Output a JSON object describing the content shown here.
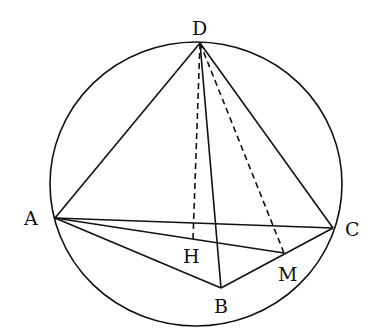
{
  "diagram": {
    "type": "geometry-figure",
    "stroke_color": "#111111",
    "background": "#ffffff",
    "circle": {
      "cx": 196,
      "cy": 184,
      "rx": 146,
      "ry": 142
    },
    "points": {
      "D": {
        "label": "D",
        "x": 200,
        "y": 43,
        "label_x": 192,
        "label_y": 35
      },
      "A": {
        "label": "A",
        "x": 55,
        "y": 218,
        "label_x": 24,
        "label_y": 225
      },
      "C": {
        "label": "C",
        "x": 333,
        "y": 228,
        "label_x": 345,
        "label_y": 236
      },
      "B": {
        "label": "B",
        "x": 221,
        "y": 288,
        "label_x": 214,
        "label_y": 313
      },
      "H": {
        "label": "H",
        "x": 193,
        "y": 239,
        "label_x": 183,
        "label_y": 263
      },
      "M": {
        "label": "M",
        "x": 284,
        "y": 253,
        "label_x": 278,
        "label_y": 281
      }
    },
    "solid_segments": [
      [
        "D",
        "A"
      ],
      [
        "D",
        "C"
      ],
      [
        "D",
        "B"
      ],
      [
        "A",
        "C"
      ],
      [
        "A",
        "B"
      ],
      [
        "B",
        "C"
      ],
      [
        "A",
        "M"
      ]
    ],
    "dashed_segments": [
      [
        "D",
        "H"
      ],
      [
        "D",
        "M"
      ]
    ]
  }
}
